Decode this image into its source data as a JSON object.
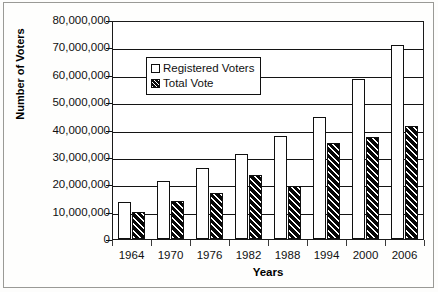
{
  "chart_data": {
    "type": "bar",
    "title": "",
    "xlabel": "Years",
    "ylabel": "Number of Voters",
    "categories": [
      "1964",
      "1970",
      "1976",
      "1982",
      "1988",
      "1994",
      "2000",
      "2006"
    ],
    "series": [
      {
        "name": "Registered Voters",
        "values": [
          13500000,
          21300000,
          25800000,
          31200000,
          37500000,
          44600000,
          58300000,
          71000000
        ]
      },
      {
        "name": "Total Vote",
        "values": [
          9900000,
          13900000,
          16800000,
          23400000,
          19300000,
          35000000,
          37200000,
          41300000
        ]
      }
    ],
    "ylim": [
      0,
      80000000
    ],
    "ytick_values": [
      0,
      10000000,
      20000000,
      30000000,
      40000000,
      50000000,
      60000000,
      70000000,
      80000000
    ],
    "ytick_labels": [
      "0",
      "10,000,000",
      "20,000,000",
      "30,000,000",
      "40,000,000",
      "50,000,000",
      "60,000,000",
      "70,000,000",
      "80,000,000"
    ],
    "grid": true,
    "legend_position": "upper-left-inside",
    "colors": {
      "registered_voters": "#ffffff",
      "total_vote": "#0a0a0a",
      "axis": "#141414",
      "text": "#111111"
    }
  },
  "legend": {
    "items": [
      {
        "label": "Registered Voters",
        "swatch": "white-square-icon"
      },
      {
        "label": "Total Vote",
        "swatch": "hatched-square-icon"
      }
    ]
  }
}
